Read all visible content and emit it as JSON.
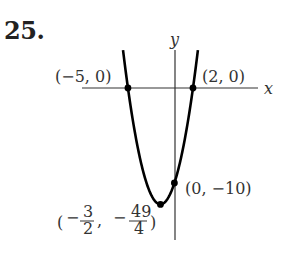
{
  "problem": {
    "number": "25."
  },
  "chart_data": {
    "type": "line",
    "title": "",
    "function": "y = (x + 5)(x - 2) = x^2 + 3x - 10",
    "xlabel": "x",
    "ylabel": "y",
    "grid": false,
    "xlim": [
      -10.3,
      8.9
    ],
    "ylim": [
      -16.2,
      4.0
    ],
    "points": [
      {
        "label": "(−5, 0)",
        "x": -5,
        "y": 0
      },
      {
        "label": "(2, 0)",
        "x": 2,
        "y": 0
      },
      {
        "label": "(0, −10)",
        "x": 0,
        "y": -10
      },
      {
        "label": "(−3/2, −49/4)",
        "x": -1.5,
        "y": -12.25
      }
    ],
    "annotations": {
      "x_intercept_left": "(−5, 0)",
      "x_intercept_right": "(2, 0)",
      "y_intercept": "(0, −10)",
      "vertex_num_x": "3",
      "vertex_den_x": "2",
      "vertex_num_y": "49",
      "vertex_den_y": "4"
    }
  },
  "colors": {
    "curve": "#000000",
    "axis": "#333333",
    "text": "#333333"
  }
}
